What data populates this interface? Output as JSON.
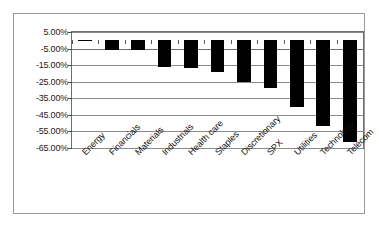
{
  "chart": {
    "title": "",
    "xlabel": "",
    "ylabel": "",
    "frame_color": "#9a9a9a",
    "bar_color": "#000000",
    "grid_color": "#8a8a8a"
  },
  "chart_data": {
    "type": "bar",
    "title": "",
    "xlabel": "",
    "ylabel": "",
    "ylim": [
      -65,
      5
    ],
    "grid": true,
    "legend": "none",
    "orientation": "vertical",
    "yticks": [
      5,
      -5,
      -15,
      -25,
      -35,
      -45,
      -55,
      -65
    ],
    "ytick_labels": [
      "5.00%",
      "-5.00%",
      "-15.00%",
      "-25.00%",
      "-35.00%",
      "-45.00%",
      "-55.00%",
      "-65.00%"
    ],
    "categories": [
      "Energy",
      "Financials",
      "Materials",
      "Industrials",
      "Health care",
      "Staples",
      "Discretionary",
      "SPX",
      "Utilities",
      "Technology",
      "Telecom"
    ],
    "values": [
      -0.5,
      -6.0,
      -6.0,
      -16.0,
      -16.5,
      -19.0,
      -25.0,
      -29.0,
      -40.5,
      -52.0,
      -61.5
    ]
  }
}
